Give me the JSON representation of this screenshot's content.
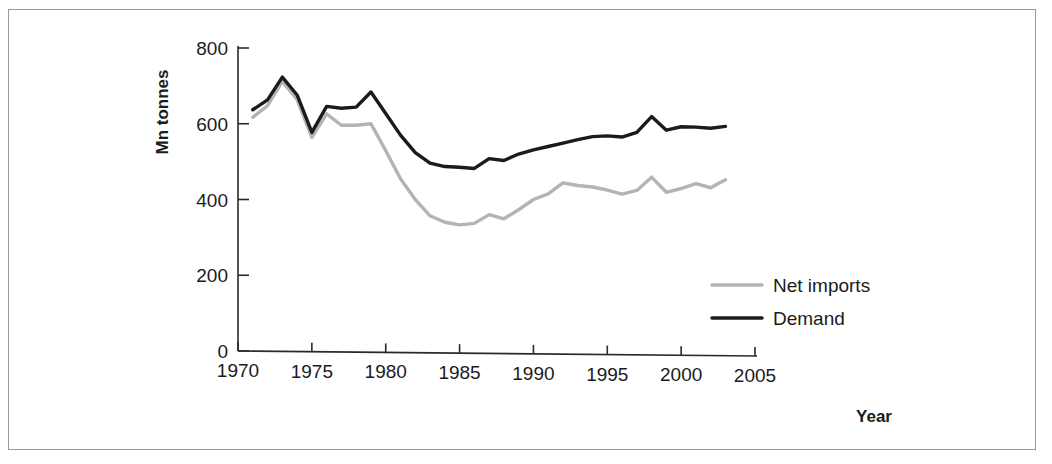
{
  "figure": {
    "background_color": "#ffffff",
    "frame_color": "#9a9a9a"
  },
  "axis": {
    "y_title": "Mn tonnes",
    "x_title": "Year",
    "y_ticks": [
      "0",
      "200",
      "400",
      "600",
      "800"
    ],
    "x_ticks": [
      "1970",
      "1975",
      "1980",
      "1985",
      "1990",
      "1995",
      "2000",
      "2005"
    ]
  },
  "legend": {
    "items": [
      {
        "label": "Net imports",
        "color": "#b4b4b4"
      },
      {
        "label": "Demand",
        "color": "#1b1b1b"
      }
    ]
  },
  "chart_data": {
    "type": "line",
    "title": "",
    "subtitle": "",
    "xlabel": "Year",
    "ylabel": "Mn tonnes",
    "xlim": [
      1970,
      2005
    ],
    "ylim": [
      0,
      800
    ],
    "x_tick_step": 5,
    "y_tick_step": 200,
    "grid": false,
    "legend_position": "inside-bottom-right",
    "x": [
      1971,
      1972,
      1973,
      1974,
      1975,
      1976,
      1977,
      1978,
      1979,
      1980,
      1981,
      1982,
      1983,
      1984,
      1985,
      1986,
      1987,
      1988,
      1989,
      1990,
      1991,
      1992,
      1993,
      1994,
      1995,
      1996,
      1997,
      1998,
      1999,
      2000,
      2001,
      2002,
      2003
    ],
    "series": [
      {
        "name": "Demand",
        "color": "#1b1b1b",
        "values": [
          637,
          663,
          723,
          676,
          577,
          646,
          641,
          644,
          684,
          627,
          570,
          524,
          496,
          487,
          485,
          482,
          508,
          503,
          520,
          531,
          540,
          549,
          558,
          566,
          568,
          565,
          577,
          619,
          583,
          592,
          591,
          588,
          593
        ]
      },
      {
        "name": "Net imports",
        "color": "#b4b4b4",
        "values": [
          617,
          648,
          712,
          664,
          564,
          626,
          596,
          596,
          600,
          529,
          455,
          400,
          357,
          340,
          333,
          337,
          360,
          349,
          373,
          400,
          415,
          444,
          437,
          433,
          425,
          414,
          424,
          459,
          419,
          429,
          442,
          431,
          452
        ]
      }
    ]
  }
}
